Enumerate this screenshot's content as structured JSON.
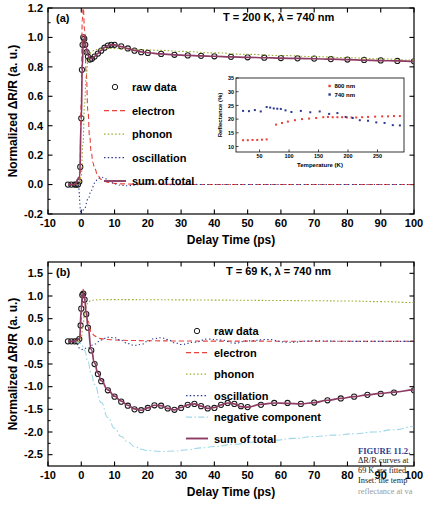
{
  "figure": {
    "caption_title": "FIGURE 11.2.",
    "caption_lines": [
      "ΔR/R curves at",
      "69 K are fitted",
      "Inset: the temp",
      "reflectance at va"
    ]
  },
  "colors": {
    "raw_data": "#1a1a1a",
    "electron": "#e8403a",
    "phonon": "#9aad2e",
    "oscillation": "#2b3990",
    "sum_of_total": "#8e3b63",
    "negative_component": "#9ed8e8",
    "inset_800nm": "#e8403a",
    "inset_740nm": "#2b3990",
    "axis": "#000000"
  },
  "chart_data": [
    {
      "id": "panel-a",
      "type": "line",
      "panel_label": "(a)",
      "title": "T = 200 K, λ = 740 nm",
      "temperature_K": 200,
      "wavelength_nm": 740,
      "xlabel": "Delay Time (ps)",
      "ylabel": "Normalized ΔR/R (a. u.)",
      "xlim": [
        -10,
        100
      ],
      "ylim": [
        -0.2,
        1.2
      ],
      "xticks": [
        -10,
        0,
        10,
        20,
        30,
        40,
        50,
        60,
        70,
        80,
        90,
        100
      ],
      "yticks": [
        -0.2,
        0.0,
        0.2,
        0.4,
        0.6,
        0.8,
        1.0,
        1.2
      ],
      "grid": false,
      "legend_position": "center-left",
      "legend": [
        {
          "label": "raw data",
          "style": "open-circles",
          "color": "#1a1a1a"
        },
        {
          "label": "electron",
          "style": "dashed",
          "color": "#e8403a"
        },
        {
          "label": "phonon",
          "style": "dotted",
          "color": "#9aad2e"
        },
        {
          "label": "oscillation",
          "style": "dotted",
          "color": "#2b3990"
        },
        {
          "label": "sum of total",
          "style": "solid",
          "color": "#8e3b63"
        }
      ],
      "series": [
        {
          "name": "raw data",
          "x": [
            -4,
            -3,
            -2,
            -1.5,
            -1,
            -0.6,
            -0.3,
            0,
            0.2,
            0.4,
            0.6,
            0.9,
            1.2,
            1.6,
            2,
            2.6,
            3.2,
            4,
            5,
            6,
            7,
            8,
            9,
            10,
            12,
            14,
            16,
            18,
            20,
            24,
            28,
            32,
            36,
            40,
            45,
            50,
            55,
            60,
            65,
            70,
            75,
            80,
            85,
            90,
            95,
            100
          ],
          "y": [
            0.0,
            0.0,
            0.0,
            0.0,
            0.0,
            0.02,
            0.12,
            0.45,
            0.78,
            0.95,
            1.0,
            0.99,
            0.95,
            0.9,
            0.87,
            0.85,
            0.855,
            0.87,
            0.89,
            0.91,
            0.93,
            0.945,
            0.95,
            0.95,
            0.94,
            0.925,
            0.91,
            0.9,
            0.895,
            0.888,
            0.882,
            0.878,
            0.875,
            0.872,
            0.868,
            0.865,
            0.862,
            0.86,
            0.858,
            0.856,
            0.853,
            0.85,
            0.847,
            0.844,
            0.84,
            0.838
          ]
        },
        {
          "name": "electron",
          "x": [
            -2,
            -0.5,
            0,
            0.3,
            0.6,
            1,
            1.5,
            2,
            2.5,
            3,
            3.5,
            4,
            5,
            6,
            7,
            8,
            10,
            12,
            15,
            20,
            30,
            40,
            60,
            80,
            100
          ],
          "y": [
            0.0,
            0.0,
            0.55,
            1.12,
            1.2,
            1.05,
            0.75,
            0.5,
            0.33,
            0.22,
            0.15,
            0.11,
            0.06,
            0.035,
            0.022,
            0.015,
            0.008,
            0.005,
            0.003,
            0.002,
            0.001,
            0.0,
            0.0,
            0.0,
            0.0
          ]
        },
        {
          "name": "phonon",
          "x": [
            -2,
            -0.5,
            0,
            0.5,
            1,
            1.5,
            2,
            3,
            4,
            5,
            6,
            8,
            10,
            14,
            18,
            24,
            30,
            40,
            50,
            60,
            70,
            80,
            90,
            100
          ],
          "y": [
            0.0,
            0.0,
            0.06,
            0.28,
            0.55,
            0.74,
            0.84,
            0.9,
            0.915,
            0.92,
            0.923,
            0.925,
            0.925,
            0.922,
            0.918,
            0.912,
            0.905,
            0.895,
            0.885,
            0.877,
            0.87,
            0.862,
            0.854,
            0.846
          ]
        },
        {
          "name": "oscillation",
          "x": [
            -2,
            -1,
            0,
            1,
            2,
            3,
            4,
            5,
            6,
            7,
            8,
            9,
            10,
            11,
            12,
            14,
            16,
            18,
            20,
            24,
            28,
            34,
            40,
            50,
            60,
            80,
            100
          ],
          "y": [
            0.0,
            0.0,
            -0.2,
            -0.16,
            -0.1,
            -0.04,
            0.01,
            0.04,
            0.05,
            0.045,
            0.03,
            0.015,
            0.005,
            -0.002,
            -0.006,
            -0.008,
            -0.004,
            0.001,
            0.004,
            0.003,
            -0.001,
            0.001,
            0.0,
            0.0,
            0.0,
            0.0,
            0.0
          ]
        },
        {
          "name": "sum of total",
          "x": [
            -4,
            -2,
            -0.5,
            0,
            0.3,
            0.6,
            1,
            1.5,
            2,
            2.6,
            3.2,
            4,
            5,
            6,
            7,
            8,
            9,
            10,
            12,
            14,
            16,
            18,
            20,
            24,
            28,
            32,
            36,
            40,
            45,
            50,
            55,
            60,
            65,
            70,
            75,
            80,
            85,
            90,
            95,
            100
          ],
          "y": [
            0.0,
            0.0,
            0.05,
            0.44,
            0.8,
            0.97,
            1.0,
            0.93,
            0.88,
            0.855,
            0.857,
            0.872,
            0.892,
            0.912,
            0.932,
            0.945,
            0.95,
            0.949,
            0.938,
            0.924,
            0.912,
            0.902,
            0.896,
            0.888,
            0.882,
            0.878,
            0.875,
            0.872,
            0.868,
            0.865,
            0.862,
            0.859,
            0.857,
            0.855,
            0.852,
            0.849,
            0.846,
            0.843,
            0.84,
            0.837
          ]
        }
      ],
      "inset": {
        "type": "scatter",
        "xlabel": "Temperature (K)",
        "ylabel": "Reflectance (%)",
        "xlim": [
          10,
          295
        ],
        "ylim": [
          8,
          35
        ],
        "xticks": [
          50,
          100,
          150,
          200,
          250
        ],
        "yticks": [
          10,
          15,
          20,
          25,
          30,
          35
        ],
        "legend_position": "top-right",
        "series": [
          {
            "name": "800 nm",
            "color": "#e8403a",
            "x": [
              22,
              30,
              38,
              46,
              54,
              62,
              78,
              88,
              98,
              110,
              122,
              134,
              146,
              158,
              166,
              174,
              182,
              190,
              198,
              206,
              214,
              224,
              234,
              246,
              258,
              268,
              278,
              288
            ],
            "y": [
              12.3,
              12.3,
              12.4,
              12.4,
              12.5,
              12.6,
              18.0,
              18.6,
              19.1,
              19.6,
              20.0,
              20.2,
              20.4,
              20.7,
              20.8,
              20.7,
              20.7,
              20.7,
              20.6,
              20.6,
              20.6,
              20.7,
              20.8,
              20.9,
              21.0,
              21.0,
              21.1,
              21.1
            ]
          },
          {
            "name": "740 nm",
            "color": "#2b3990",
            "x": [
              22,
              32,
              42,
              52,
              62,
              68,
              74,
              80,
              86,
              94,
              104,
              120,
              136,
              152,
              168,
              182,
              196,
              208,
              220,
              234,
              248,
              262,
              276,
              288
            ],
            "y": [
              23.0,
              22.9,
              23.3,
              22.8,
              24.4,
              24.2,
              23.9,
              23.8,
              23.7,
              23.2,
              22.6,
              23.0,
              22.5,
              22.8,
              21.9,
              22.2,
              20.8,
              20.4,
              19.6,
              19.4,
              18.8,
              18.6,
              17.8,
              17.7
            ]
          }
        ]
      }
    },
    {
      "id": "panel-b",
      "type": "line",
      "panel_label": "(b)",
      "title": "T = 69 K, λ = 740 nm",
      "temperature_K": 69,
      "wavelength_nm": 740,
      "xlabel": "Delay Time (ps)",
      "ylabel": "Normalized ΔR/R (a. u.)",
      "xlim": [
        -10,
        100
      ],
      "ylim": [
        -2.75,
        1.75
      ],
      "xticks": [
        -10,
        0,
        10,
        20,
        30,
        40,
        50,
        60,
        70,
        80,
        90,
        100
      ],
      "yticks": [
        -2.5,
        -2.0,
        -1.5,
        -1.0,
        -0.5,
        0.0,
        0.5,
        1.0,
        1.5
      ],
      "grid": false,
      "legend_position": "center-right",
      "legend": [
        {
          "label": "raw data",
          "style": "open-circles",
          "color": "#1a1a1a"
        },
        {
          "label": "electron",
          "style": "dashed",
          "color": "#e8403a"
        },
        {
          "label": "phonon",
          "style": "dotted",
          "color": "#9aad2e"
        },
        {
          "label": "oscillation",
          "style": "dotted",
          "color": "#2b3990"
        },
        {
          "label": "negative component",
          "style": "dash-dot",
          "color": "#9ed8e8"
        },
        {
          "label": "sum of total",
          "style": "solid",
          "color": "#8e3b63"
        }
      ],
      "series": [
        {
          "name": "raw data",
          "x": [
            -4,
            -3,
            -2,
            -1.2,
            -0.6,
            -0.2,
            0,
            0.3,
            0.6,
            1,
            1.5,
            2,
            3,
            4,
            5,
            6,
            8,
            10,
            12,
            14,
            16,
            18,
            20,
            22,
            24,
            26,
            28,
            30,
            32,
            34,
            36,
            38,
            40,
            42,
            44,
            46,
            48,
            50,
            54,
            58,
            62,
            66,
            70,
            74,
            78,
            82,
            86,
            90,
            94,
            100
          ],
          "y": [
            0.0,
            0.0,
            0.0,
            0.0,
            0.05,
            0.35,
            0.72,
            1.02,
            1.05,
            0.92,
            0.6,
            0.3,
            -0.2,
            -0.5,
            -0.72,
            -0.88,
            -1.08,
            -1.22,
            -1.33,
            -1.42,
            -1.5,
            -1.52,
            -1.47,
            -1.41,
            -1.42,
            -1.48,
            -1.51,
            -1.47,
            -1.4,
            -1.38,
            -1.43,
            -1.48,
            -1.47,
            -1.4,
            -1.36,
            -1.38,
            -1.43,
            -1.45,
            -1.4,
            -1.36,
            -1.36,
            -1.38,
            -1.35,
            -1.3,
            -1.26,
            -1.22,
            -1.18,
            -1.16,
            -1.13,
            -1.08
          ]
        },
        {
          "name": "electron",
          "x": [
            -2,
            -0.5,
            0,
            0.3,
            0.6,
            1,
            1.5,
            2,
            3,
            4,
            5,
            6,
            8,
            10,
            14,
            20,
            30,
            40,
            50,
            60,
            70,
            80,
            90,
            100
          ],
          "y": [
            0.0,
            0.0,
            0.5,
            1.08,
            1.15,
            1.0,
            0.7,
            0.45,
            0.2,
            0.12,
            0.08,
            0.06,
            0.04,
            0.03,
            0.02,
            0.012,
            0.008,
            0.005,
            0.004,
            0.003,
            0.002,
            0.002,
            0.001,
            0.001
          ]
        },
        {
          "name": "phonon",
          "x": [
            -2,
            -0.5,
            0,
            0.5,
            1,
            1.5,
            2,
            3,
            4,
            5,
            6,
            8,
            10,
            15,
            20,
            30,
            40,
            50,
            60,
            70,
            80,
            90,
            100
          ],
          "y": [
            0.0,
            0.0,
            0.08,
            0.35,
            0.6,
            0.78,
            0.86,
            0.9,
            0.91,
            0.915,
            0.918,
            0.92,
            0.92,
            0.92,
            0.918,
            0.915,
            0.91,
            0.905,
            0.9,
            0.895,
            0.89,
            0.875,
            0.855
          ]
        },
        {
          "name": "oscillation",
          "x": [
            -2,
            0,
            2,
            4,
            6,
            8,
            10,
            12,
            14,
            16,
            18,
            20,
            22,
            24,
            26,
            28,
            30,
            34,
            38,
            42,
            46,
            50,
            56,
            62,
            70,
            80,
            90,
            100
          ],
          "y": [
            0.0,
            -0.18,
            -0.14,
            -0.06,
            0.03,
            0.09,
            0.08,
            0.02,
            -0.05,
            -0.09,
            -0.07,
            0.0,
            0.06,
            0.08,
            0.04,
            -0.03,
            -0.07,
            -0.02,
            0.05,
            0.03,
            -0.04,
            0.01,
            0.04,
            -0.02,
            0.01,
            0.0,
            0.0,
            0.0
          ]
        },
        {
          "name": "negative component",
          "x": [
            -2,
            0,
            1,
            2,
            3,
            4,
            6,
            8,
            10,
            12,
            14,
            16,
            18,
            20,
            24,
            28,
            32,
            36,
            40,
            46,
            52,
            58,
            64,
            70,
            76,
            82,
            88,
            94,
            100
          ],
          "y": [
            0.0,
            -0.05,
            -0.2,
            -0.45,
            -0.72,
            -0.95,
            -1.35,
            -1.68,
            -1.92,
            -2.1,
            -2.22,
            -2.32,
            -2.38,
            -2.41,
            -2.43,
            -2.42,
            -2.39,
            -2.35,
            -2.32,
            -2.27,
            -2.22,
            -2.18,
            -2.14,
            -2.1,
            -2.07,
            -2.04,
            -2.0,
            -1.95,
            -1.88
          ]
        },
        {
          "name": "sum of total",
          "x": [
            -4,
            -2,
            -0.5,
            0,
            0.3,
            0.6,
            1,
            1.5,
            2,
            3,
            4,
            5,
            6,
            8,
            10,
            12,
            14,
            16,
            18,
            20,
            22,
            24,
            26,
            28,
            30,
            32,
            34,
            36,
            38,
            40,
            42,
            44,
            46,
            48,
            50,
            54,
            58,
            62,
            66,
            70,
            74,
            78,
            82,
            86,
            90,
            94,
            100
          ],
          "y": [
            0.0,
            0.0,
            0.06,
            0.7,
            1.0,
            1.06,
            0.93,
            0.62,
            0.32,
            -0.18,
            -0.48,
            -0.7,
            -0.87,
            -1.07,
            -1.21,
            -1.32,
            -1.41,
            -1.49,
            -1.52,
            -1.47,
            -1.41,
            -1.42,
            -1.48,
            -1.51,
            -1.46,
            -1.4,
            -1.38,
            -1.43,
            -1.48,
            -1.46,
            -1.4,
            -1.36,
            -1.38,
            -1.44,
            -1.45,
            -1.39,
            -1.36,
            -1.37,
            -1.38,
            -1.35,
            -1.3,
            -1.26,
            -1.22,
            -1.18,
            -1.15,
            -1.12,
            -1.07
          ]
        }
      ]
    }
  ]
}
